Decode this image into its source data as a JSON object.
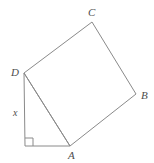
{
  "figure": {
    "background_color": "#ffffff",
    "stroke_color": "#8a8a8a",
    "stroke_width": 1,
    "label_color": "#4d4d4d"
  },
  "labels": {
    "vertex_a": "A",
    "vertex_b": "B",
    "vertex_c": "C",
    "vertex_d": "D",
    "side_x": "x"
  },
  "geometry": {
    "square": {
      "name": "square-ABCD",
      "points": "24,73 92,22 136,94 70,146",
      "vertices": [
        {
          "id": "D",
          "x": 24,
          "y": 73
        },
        {
          "id": "C",
          "x": 92,
          "y": 22
        },
        {
          "id": "B",
          "x": 136,
          "y": 94
        },
        {
          "id": "A",
          "x": 70,
          "y": 146
        }
      ]
    },
    "triangle": {
      "name": "right-triangle-D-corner-A",
      "points": "24,73 25,146 70,146",
      "vertices": [
        {
          "id": "D",
          "x": 24,
          "y": 73
        },
        {
          "id": "corner",
          "x": 25,
          "y": 146
        },
        {
          "id": "A",
          "x": 70,
          "y": 146
        }
      ]
    },
    "right_angle_marker": {
      "name": "right-angle-square",
      "points": "25,138 33,138 33,146",
      "size": 8,
      "corner_x": 25,
      "corner_y": 146
    },
    "vertical_side": {
      "name": "segment-x",
      "x1": 24,
      "y1": 73,
      "x2": 25,
      "y2": 146
    },
    "horizontal_side": {
      "name": "segment-base",
      "x1": 25,
      "y1": 146,
      "x2": 70,
      "y2": 146
    },
    "hypotenuse": {
      "name": "segment-DA",
      "x1": 24,
      "y1": 73,
      "x2": 70,
      "y2": 146
    }
  }
}
